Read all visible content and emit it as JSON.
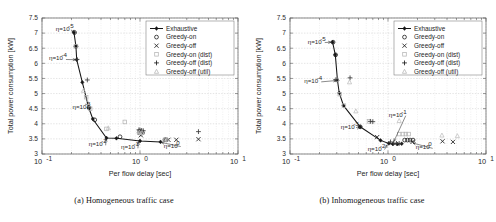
{
  "figures": [
    {
      "id": "a",
      "caption": "(a) Homogeneous traffic case",
      "chart_data": {
        "type": "scatter",
        "title": "",
        "xlabel": "Per flow delay [sec]",
        "ylabel": "Total power consumption [kW]",
        "xscale": "log",
        "yscale": "linear",
        "xlim": [
          0.1,
          10
        ],
        "ylim": [
          3,
          7.5
        ],
        "xticks": [
          "10^-1",
          "10^0",
          "10^1"
        ],
        "yticks": [
          "3",
          "3.5",
          "4",
          "4.5",
          "5",
          "5.5",
          "6",
          "6.5",
          "7",
          "7.5"
        ],
        "grid": true,
        "legend_position": "top-right",
        "series": [
          {
            "name": "Exhaustive",
            "marker": "diamond-line",
            "color": "#161616",
            "points": [
              [
                0.212,
                7.02
              ],
              [
                0.222,
                6.56
              ],
              [
                0.226,
                6.12
              ],
              [
                0.258,
                5.37
              ],
              [
                0.3,
                4.53
              ],
              [
                0.33,
                4.16
              ],
              [
                0.455,
                3.53
              ],
              [
                0.575,
                3.52
              ],
              [
                1.0,
                3.43
              ],
              [
                1.62,
                3.4
              ]
            ]
          },
          {
            "name": "Greedy-on",
            "marker": "circle",
            "color": "#1d1d1d",
            "points": [
              [
                0.215,
                7.02
              ],
              [
                0.222,
                6.56
              ],
              [
                0.302,
                4.53
              ],
              [
                0.345,
                4.13
              ],
              [
                0.625,
                3.57
              ],
              [
                0.98,
                3.7
              ],
              [
                1.02,
                3.7
              ],
              [
                1.06,
                3.7
              ],
              [
                1.8,
                3.47
              ],
              [
                1.86,
                3.47
              ]
            ]
          },
          {
            "name": "Greedy-off",
            "marker": "x",
            "color": "#1d1d1d",
            "points": [
              [
                1.02,
                3.62
              ],
              [
                1.95,
                3.47
              ],
              [
                2.35,
                3.47
              ],
              [
                3.95,
                3.49
              ]
            ]
          },
          {
            "name": "Greedy-on (dist)",
            "marker": "square",
            "color": "#b4b4b4",
            "points": [
              [
                0.222,
                6.57
              ],
              [
                0.282,
                4.88
              ],
              [
                0.31,
                4.5
              ],
              [
                0.455,
                3.83
              ],
              [
                0.7,
                4.06
              ],
              [
                0.98,
                3.72
              ],
              [
                1.03,
                3.7
              ],
              [
                1.8,
                3.47
              ]
            ]
          },
          {
            "name": "Greedy-off (dist)",
            "marker": "plus",
            "color": "#3a3a3a",
            "points": [
              [
                0.228,
                6.13
              ],
              [
                0.29,
                5.45
              ],
              [
                0.975,
                3.8
              ],
              [
                1.0,
                3.79
              ],
              [
                1.04,
                3.78
              ],
              [
                1.08,
                3.77
              ],
              [
                3.95,
                3.74
              ]
            ]
          },
          {
            "name": "Greedy-off (util)",
            "marker": "triangle",
            "color": "#bdbdbd",
            "points": [
              [
                0.265,
                5.1
              ],
              [
                0.292,
                4.7
              ],
              [
                0.475,
                3.86
              ],
              [
                0.985,
                3.72
              ],
              [
                1.05,
                3.71
              ],
              [
                1.88,
                3.49
              ]
            ]
          }
        ],
        "annotations": [
          {
            "text": "η=10",
            "exp": "-5",
            "x": 0.138,
            "y": 7.12,
            "arrow_to": [
              0.205,
              7.02
            ]
          },
          {
            "text": "η=10",
            "exp": "-4",
            "x": 0.118,
            "y": 6.16,
            "arrow_to": [
              0.22,
              6.12
            ]
          },
          {
            "text": "η=10",
            "exp": "-3",
            "x": 0.205,
            "y": 4.54,
            "arrow_to": [
              0.292,
              4.53
            ]
          },
          {
            "text": "η=10",
            "exp": "-2",
            "x": 0.3,
            "y": 3.32,
            "arrow_to": [
              0.45,
              3.5
            ]
          },
          {
            "text": "η=10",
            "exp": "-1",
            "x": 0.64,
            "y": 3.22,
            "arrow_to": [
              0.965,
              3.4
            ]
          },
          {
            "text": "η=10",
            "exp": "0",
            "x": 1.75,
            "y": 3.28,
            "arrow_to": [
              1.66,
              3.38
            ]
          }
        ]
      }
    },
    {
      "id": "b",
      "caption": "(b) Inhomogeneous traffic case",
      "chart_data": {
        "type": "scatter",
        "title": "",
        "xlabel": "Per flow delay [sec]",
        "ylabel": "Total power consumption [kW]",
        "xscale": "log",
        "yscale": "linear",
        "xlim": [
          0.1,
          10
        ],
        "ylim": [
          3,
          7.5
        ],
        "xticks": [
          "10^-1",
          "10^0",
          "10^1"
        ],
        "yticks": [
          "3",
          "3.5",
          "4",
          "4.5",
          "5",
          "5.5",
          "6",
          "6.5",
          "7",
          "7.5"
        ],
        "grid": true,
        "legend_position": "top-right",
        "series": [
          {
            "name": "Exhaustive",
            "marker": "diamond-line",
            "color": "#161616",
            "points": [
              [
                0.272,
                6.7
              ],
              [
                0.29,
                6.28
              ],
              [
                0.305,
                5.44
              ],
              [
                0.318,
                5.02
              ],
              [
                0.352,
                4.6
              ],
              [
                0.52,
                3.9
              ],
              [
                0.84,
                3.45
              ],
              [
                1.02,
                3.35
              ],
              [
                1.12,
                3.33
              ],
              [
                1.25,
                3.33
              ],
              [
                1.38,
                3.34
              ]
            ]
          },
          {
            "name": "Greedy-on",
            "marker": "circle",
            "color": "#1d1d1d",
            "points": [
              [
                0.275,
                6.7
              ],
              [
                0.292,
                6.28
              ],
              [
                0.52,
                3.9
              ],
              [
                1.48,
                3.46
              ],
              [
                1.58,
                3.46
              ],
              [
                1.68,
                3.46
              ],
              [
                1.8,
                3.46
              ]
            ]
          },
          {
            "name": "Greedy-off",
            "marker": "x",
            "color": "#1d1d1d",
            "points": [
              [
                0.775,
                3.56
              ],
              [
                1.78,
                3.4
              ],
              [
                3.6,
                3.42
              ],
              [
                4.6,
                3.4
              ]
            ]
          },
          {
            "name": "Greedy-on (dist)",
            "marker": "square",
            "color": "#b4b4b4",
            "points": [
              [
                0.3,
                5.45
              ],
              [
                0.322,
                4.98
              ],
              [
                0.355,
                4.6
              ],
              [
                0.64,
                4.08
              ],
              [
                1.3,
                3.66
              ],
              [
                1.42,
                3.66
              ],
              [
                1.52,
                3.66
              ],
              [
                1.62,
                3.66
              ]
            ]
          },
          {
            "name": "Greedy-off (dist)",
            "marker": "plus",
            "color": "#3a3a3a",
            "points": [
              [
                0.295,
                5.46
              ],
              [
                0.41,
                5.52
              ],
              [
                0.66,
                4.08
              ],
              [
                0.7,
                4.07
              ],
              [
                1.06,
                3.4
              ],
              [
                1.14,
                3.36
              ],
              [
                1.22,
                3.35
              ],
              [
                1.3,
                3.35
              ]
            ]
          },
          {
            "name": "Greedy-off (util)",
            "marker": "triangle",
            "color": "#bdbdbd",
            "points": [
              [
                0.405,
                5.38
              ],
              [
                0.47,
                4.42
              ],
              [
                1.3,
                4.1
              ],
              [
                3.55,
                3.62
              ],
              [
                5.1,
                3.6
              ]
            ]
          }
        ],
        "annotations": [
          {
            "text": "η=10",
            "exp": "-5",
            "x": 0.152,
            "y": 6.72,
            "arrow_to": [
              0.262,
              6.7
            ]
          },
          {
            "text": "η=10",
            "exp": "-4",
            "x": 0.14,
            "y": 5.42,
            "arrow_to": [
              0.295,
              5.43
            ]
          },
          {
            "text": "η=10",
            "exp": "-3",
            "x": 0.33,
            "y": 3.9,
            "arrow_to": [
              0.505,
              3.9
            ]
          },
          {
            "text": "η=10",
            "exp": "-2",
            "x": 0.62,
            "y": 3.18,
            "arrow_to": [
              0.98,
              3.3
            ]
          },
          {
            "text": "η=10",
            "exp": "-1",
            "x": 1.02,
            "y": 4.3,
            "arrow_to": [
              1.15,
              3.42
            ]
          },
          {
            "text": "η=10",
            "exp": "0",
            "x": 1.92,
            "y": 3.22,
            "arrow_to": [
              1.8,
              3.36
            ]
          }
        ]
      }
    }
  ],
  "legend_entries": [
    {
      "label": "Exhaustive",
      "marker": "diamond-line"
    },
    {
      "label": "Greedy-on",
      "marker": "circle"
    },
    {
      "label": "Greedy-off",
      "marker": "x"
    },
    {
      "label": "Greedy-on (dist)",
      "marker": "square"
    },
    {
      "label": "Greedy-off (dist)",
      "marker": "plus"
    },
    {
      "label": "Greedy-off (util)",
      "marker": "triangle"
    }
  ]
}
